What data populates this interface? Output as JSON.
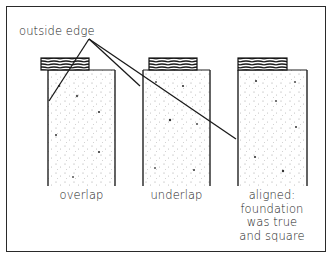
{
  "diagram": {
    "callout": "outside edge",
    "panels": [
      {
        "id": "overlap",
        "caption": [
          "overlap"
        ]
      },
      {
        "id": "underlap",
        "caption": [
          "underlap"
        ]
      },
      {
        "id": "aligned",
        "caption": [
          "aligned:",
          "foundation",
          "was true",
          "and square"
        ]
      }
    ],
    "colors": {
      "ink": "#222222",
      "stipple": "#9a9a9a",
      "background": "#ffffff"
    }
  }
}
